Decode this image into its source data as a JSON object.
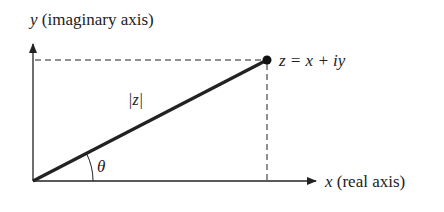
{
  "diagram": {
    "y_axis_label_var": "y",
    "y_axis_label_text": " (imaginary axis)",
    "x_axis_label_var": "x",
    "x_axis_label_text": " (real axis)",
    "point_label": "z = x + iy",
    "magnitude_label": "|z|",
    "angle_label": "θ",
    "colors": {
      "ink": "#222222",
      "background": "#ffffff"
    }
  }
}
